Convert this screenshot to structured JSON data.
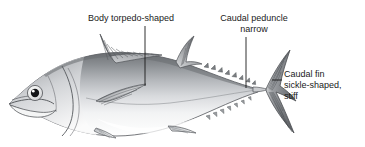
{
  "figure": {
    "background_color": "#ffffff",
    "ink_color": "#1a1a1a",
    "body_dark": "#6f7276",
    "body_mid": "#b9bcc0",
    "body_light": "#fdfdfd",
    "fin_dark": "#5f6266"
  },
  "labels": {
    "body": {
      "text": "Body torpedo-shaped",
      "lines": [
        "Body torpedo-shaped"
      ]
    },
    "peduncle": {
      "text": "Caudal peduncle\nnarrow",
      "line1": "Caudal peduncle",
      "line2": "narrow"
    },
    "caudal_fin": {
      "text": "Caudal fin\nsickle-shaped,\nstiff",
      "line1": "Caudal fin",
      "line2": "sickle-shaped,",
      "line3": "stiff"
    }
  },
  "leaders": [
    {
      "name": "leader-body",
      "from_x": 145,
      "from_y": 26,
      "to_x": 145,
      "to_y": 86
    },
    {
      "name": "leader-peduncle",
      "from_x": 246,
      "from_y": 37,
      "to_x": 246,
      "to_y": 88
    },
    {
      "name": "leader-caudal-fin",
      "from_x": 272,
      "from_y": 80,
      "to_x": 282,
      "to_y": 80
    }
  ]
}
